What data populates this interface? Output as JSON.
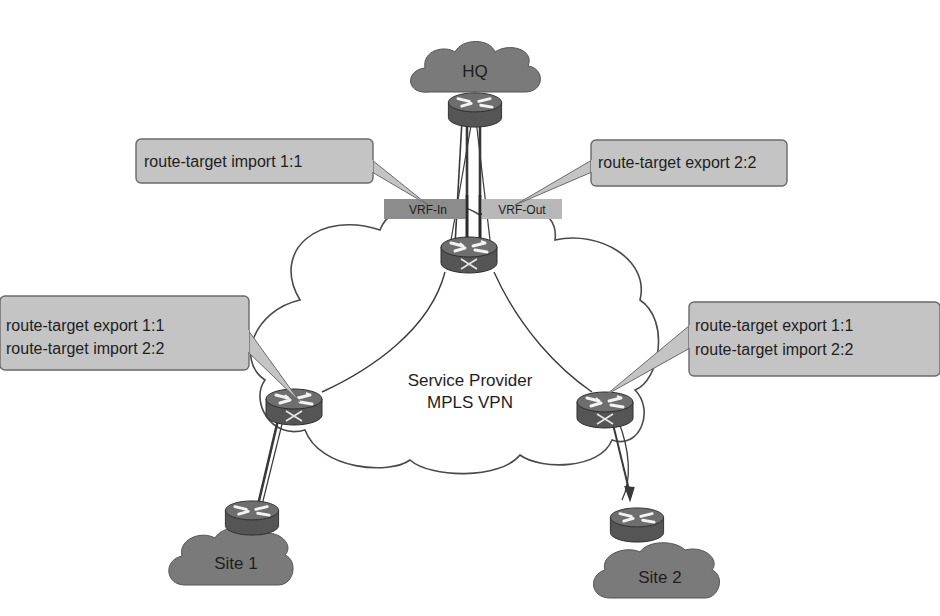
{
  "diagram": {
    "clouds": {
      "hq": {
        "label": "HQ"
      },
      "provider": {
        "line1": "Service Provider",
        "line2": "MPLS VPN"
      },
      "site1": {
        "label": "Site 1"
      },
      "site2": {
        "label": "Site 2"
      }
    },
    "vrf_labels": {
      "in": "VRF-In",
      "out": "VRF-Out"
    },
    "callouts": {
      "hq_import": {
        "line1": "route-target import 1:1"
      },
      "hq_export": {
        "line1": "route-target export 2:2"
      },
      "site1_pe": {
        "line1": "route-target export 1:1",
        "line2": "route-target import 2:2"
      },
      "site2_pe": {
        "line1": "route-target export 1:1",
        "line2": "route-target import 2:2"
      }
    },
    "colors": {
      "cloud_dark": "#7a7a7a",
      "callout_fill": "#c4c4c4",
      "callout_border": "#6a6a6a",
      "vrf_in_fill": "#8c8c8c",
      "vrf_out_fill": "#b8b8b8",
      "router_body": "#5a5a5a",
      "router_top": "#6e6e6e",
      "line": "#3a3a3a"
    }
  }
}
